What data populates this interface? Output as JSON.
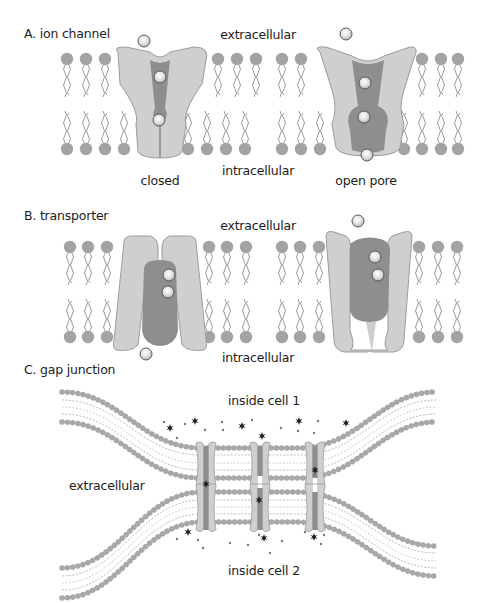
{
  "panels": {
    "A": {
      "title": "A. ion channel",
      "top_label": "extracellular",
      "bottom_label": "intracellular",
      "states": [
        {
          "label": "closed"
        },
        {
          "label": "open pore"
        }
      ]
    },
    "B": {
      "title": "B. transporter",
      "top_label": "extracellular",
      "bottom_label": "intracellular"
    },
    "C": {
      "title": "C. gap junction",
      "top_label": "inside cell 1",
      "middle_label": "extracellular",
      "bottom_label": "inside cell 2"
    }
  },
  "colors": {
    "lipid_head": "#a3a3a3",
    "lipid_tail": "#9a9a9a",
    "protein_light": "#cfcfcf",
    "protein_outline": "#9c9c9c",
    "protein_dark": "#8a8a8a",
    "ion": "#e6e6e6",
    "ion_outline": "#555555",
    "small_molecule": "#222222"
  }
}
